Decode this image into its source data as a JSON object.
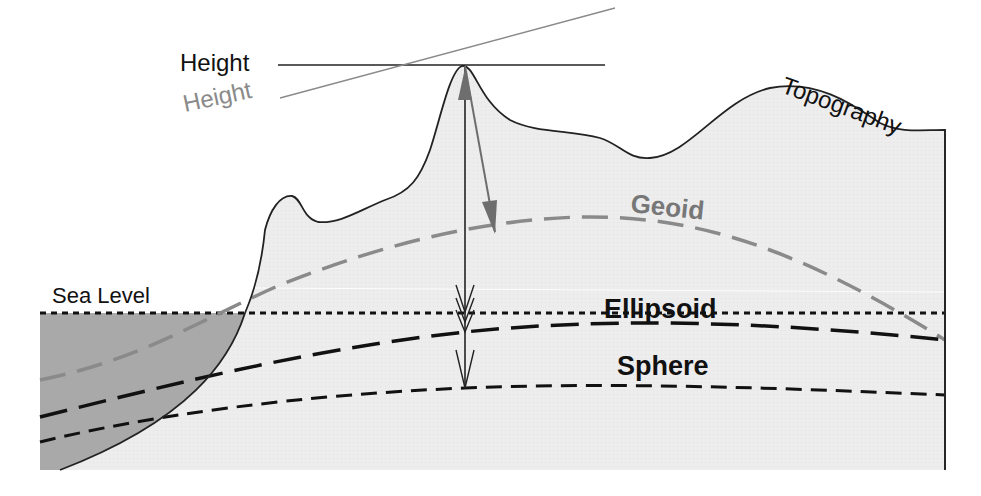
{
  "diagram": {
    "labels": {
      "height_black": "Height",
      "height_gray": "Height",
      "topography": "Topography",
      "geoid": "Geoid",
      "sea_level": "Sea Level",
      "ellipsoid": "Ellipsoid",
      "sphere": "Sphere"
    },
    "colors": {
      "land_fill": "#ececec",
      "sea_fill": "#a9a9a9",
      "outline": "#222222",
      "geoid_line": "#8a8a8a",
      "gray_text": "#8a8a8a",
      "black": "#111111"
    },
    "surfaces": [
      {
        "name": "Topography",
        "style": "solid"
      },
      {
        "name": "Geoid",
        "style": "long-dash gray"
      },
      {
        "name": "Sea Level",
        "style": "dotted black"
      },
      {
        "name": "Ellipsoid",
        "style": "long-dash black"
      },
      {
        "name": "Sphere",
        "style": "dash black"
      }
    ],
    "arrows": [
      {
        "name": "orthometric-height",
        "from": "summit",
        "to": "geoid",
        "color": "gray"
      },
      {
        "name": "vertical-height",
        "from": "summit",
        "to": "sea-level / ellipsoid / sphere",
        "color": "black"
      }
    ]
  }
}
